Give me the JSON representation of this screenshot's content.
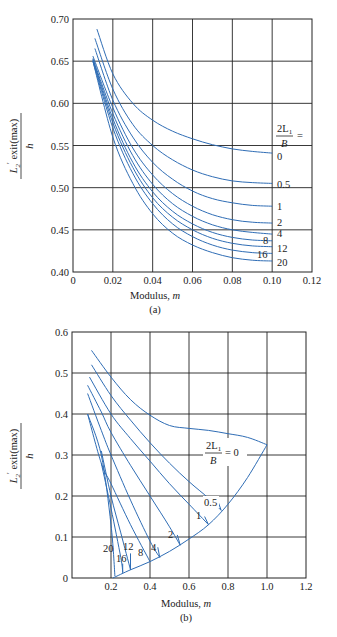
{
  "chart_data": [
    {
      "id": "a",
      "type": "line",
      "caption": "(a)",
      "xlabel": "Modulus, m",
      "ylabel": "L2' exit(max) / h",
      "xlim": [
        0,
        0.12
      ],
      "ylim": [
        0.4,
        0.7
      ],
      "xticks": [
        "0",
        "0.02",
        "0.04",
        "0.06",
        "0.08",
        "0.10",
        "0.12"
      ],
      "yticks": [
        "0.40",
        "0.45",
        "0.50",
        "0.55",
        "0.60",
        "0.65",
        "0.70"
      ],
      "grid": true,
      "legend_title": "2L1/B =",
      "series": [
        {
          "name": "0",
          "x": [
            0.012,
            0.02,
            0.03,
            0.04,
            0.05,
            0.06,
            0.07,
            0.08,
            0.09,
            0.1
          ],
          "y": [
            0.688,
            0.635,
            0.6,
            0.58,
            0.567,
            0.558,
            0.551,
            0.546,
            0.543,
            0.541
          ]
        },
        {
          "name": "0.5",
          "x": [
            0.011,
            0.02,
            0.03,
            0.04,
            0.05,
            0.06,
            0.07,
            0.08,
            0.09,
            0.1
          ],
          "y": [
            0.677,
            0.617,
            0.575,
            0.55,
            0.533,
            0.521,
            0.513,
            0.508,
            0.506,
            0.505
          ]
        },
        {
          "name": "1",
          "x": [
            0.011,
            0.02,
            0.03,
            0.04,
            0.05,
            0.06,
            0.07,
            0.08,
            0.09,
            0.1
          ],
          "y": [
            0.665,
            0.604,
            0.56,
            0.53,
            0.51,
            0.496,
            0.487,
            0.482,
            0.479,
            0.478
          ]
        },
        {
          "name": "2",
          "x": [
            0.01,
            0.02,
            0.03,
            0.04,
            0.05,
            0.06,
            0.07,
            0.08,
            0.09,
            0.1
          ],
          "y": [
            0.656,
            0.595,
            0.547,
            0.515,
            0.493,
            0.478,
            0.468,
            0.462,
            0.459,
            0.458
          ]
        },
        {
          "name": "4",
          "x": [
            0.01,
            0.02,
            0.03,
            0.04,
            0.05,
            0.06,
            0.07,
            0.08,
            0.09,
            0.1
          ],
          "y": [
            0.653,
            0.588,
            0.538,
            0.504,
            0.481,
            0.466,
            0.456,
            0.45,
            0.447,
            0.445
          ]
        },
        {
          "name": "8",
          "x": [
            0.01,
            0.02,
            0.03,
            0.04,
            0.05,
            0.06,
            0.07,
            0.08,
            0.09,
            0.1
          ],
          "y": [
            0.652,
            0.582,
            0.53,
            0.495,
            0.472,
            0.457,
            0.447,
            0.441,
            0.438,
            0.437
          ]
        },
        {
          "name": "12",
          "x": [
            0.01,
            0.02,
            0.03,
            0.04,
            0.05,
            0.06,
            0.07,
            0.08,
            0.09,
            0.1
          ],
          "y": [
            0.651,
            0.577,
            0.524,
            0.488,
            0.465,
            0.45,
            0.44,
            0.434,
            0.431,
            0.43
          ]
        },
        {
          "name": "16",
          "x": [
            0.01,
            0.02,
            0.03,
            0.04,
            0.05,
            0.06,
            0.07,
            0.08,
            0.09,
            0.1
          ],
          "y": [
            0.65,
            0.571,
            0.517,
            0.481,
            0.457,
            0.442,
            0.432,
            0.426,
            0.423,
            0.422
          ]
        },
        {
          "name": "20",
          "x": [
            0.01,
            0.02,
            0.03,
            0.04,
            0.05,
            0.06,
            0.07,
            0.08,
            0.09,
            0.1
          ],
          "y": [
            0.65,
            0.56,
            0.505,
            0.469,
            0.446,
            0.432,
            0.423,
            0.417,
            0.414,
            0.413
          ]
        }
      ]
    },
    {
      "id": "b",
      "type": "line",
      "caption": "(b)",
      "xlabel": "Modulus, m",
      "ylabel": "L2' exit(max) / h",
      "xlim": [
        0,
        1.2
      ],
      "ylim": [
        0,
        0.6
      ],
      "xticks": [
        "0.2",
        "0.4",
        "0.6",
        "0.8",
        "1.0",
        "1.2"
      ],
      "yticks": [
        "0",
        "0.1",
        "0.2",
        "0.3",
        "0.4",
        "0.5",
        "0.6"
      ],
      "grid": true,
      "legend_title": "2L1/B = 0",
      "boundary": {
        "x": [
          0.21,
          0.3,
          0.4,
          0.5,
          0.6,
          0.7,
          0.8,
          0.9,
          1.0
        ],
        "y": [
          0.0,
          0.02,
          0.04,
          0.065,
          0.095,
          0.13,
          0.18,
          0.245,
          0.325
        ]
      },
      "series": [
        {
          "name": "0",
          "x": [
            0.1,
            0.2,
            0.3,
            0.4,
            0.5,
            0.6,
            0.7,
            0.8,
            0.9,
            1.0
          ],
          "y": [
            0.555,
            0.49,
            0.435,
            0.397,
            0.372,
            0.365,
            0.36,
            0.352,
            0.343,
            0.325
          ]
        },
        {
          "name": "0.5",
          "x": [
            0.1,
            0.2,
            0.3,
            0.4,
            0.5,
            0.6,
            0.7,
            0.765
          ],
          "y": [
            0.52,
            0.445,
            0.385,
            0.33,
            0.28,
            0.235,
            0.195,
            0.165
          ]
        },
        {
          "name": "1",
          "x": [
            0.09,
            0.2,
            0.3,
            0.4,
            0.5,
            0.6,
            0.7
          ],
          "y": [
            0.49,
            0.4,
            0.34,
            0.285,
            0.23,
            0.18,
            0.13
          ]
        },
        {
          "name": "2",
          "x": [
            0.08,
            0.15,
            0.2,
            0.3,
            0.4,
            0.5,
            0.555
          ],
          "y": [
            0.47,
            0.405,
            0.355,
            0.275,
            0.2,
            0.125,
            0.08
          ]
        },
        {
          "name": "4",
          "x": [
            0.08,
            0.15,
            0.2,
            0.3,
            0.4,
            0.45
          ],
          "y": [
            0.45,
            0.36,
            0.3,
            0.19,
            0.09,
            0.05
          ]
        },
        {
          "name": "8",
          "x": [
            0.08,
            0.15,
            0.2,
            0.3,
            0.4
          ],
          "y": [
            0.4,
            0.28,
            0.23,
            0.13,
            0.04
          ]
        },
        {
          "name": "12",
          "x": [
            0.15,
            0.2,
            0.25,
            0.3
          ],
          "y": [
            0.31,
            0.2,
            0.11,
            0.02
          ]
        },
        {
          "name": "16",
          "x": [
            0.15,
            0.2,
            0.25,
            0.26
          ],
          "y": [
            0.28,
            0.17,
            0.05,
            0.015
          ]
        },
        {
          "name": "20",
          "x": [
            0.08,
            0.15,
            0.2,
            0.22
          ],
          "y": [
            0.4,
            0.3,
            0.13,
            0.005
          ]
        }
      ]
    }
  ],
  "labels": {
    "a": {
      "legend_frac_top": "2L",
      "legend_frac_sub": "1",
      "legend_frac_bottom": "B",
      "legend_eq": "=",
      "curve_labels": [
        "0",
        "0.5",
        "1",
        "2",
        "4",
        "8",
        "12",
        "16",
        "20"
      ],
      "xlabel_text": "Modulus, ",
      "xlabel_var": "m",
      "caption": "(a)"
    },
    "b": {
      "legend_frac_top": "2L",
      "legend_frac_sub": "1",
      "legend_frac_bottom": "B",
      "legend_eq": "= 0",
      "curve_labels": [
        "0.5",
        "1",
        "2",
        "4",
        "8",
        "12",
        "16",
        "20"
      ],
      "xlabel_text": "Modulus, ",
      "xlabel_var": "m",
      "caption": "(b)"
    },
    "ylabel_main": "L",
    "ylabel_sub": "2",
    "ylabel_prime": "′",
    "ylabel_rest": " exit(max)",
    "ylabel_den": "h"
  }
}
